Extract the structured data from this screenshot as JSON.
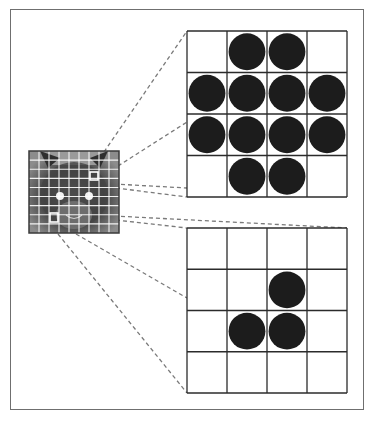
{
  "diagram": {
    "source_image": {
      "icon": "cat-face-image",
      "grid_divisions": 9,
      "highlighted_patches": [
        "top-right patch",
        "bottom-left patch"
      ]
    },
    "patches": [
      {
        "name": "top-patch",
        "rows": 4,
        "cols": 4,
        "pattern": [
          [
            0,
            1,
            1,
            0
          ],
          [
            1,
            1,
            1,
            1
          ],
          [
            1,
            1,
            1,
            1
          ],
          [
            0,
            1,
            1,
            0
          ]
        ]
      },
      {
        "name": "bottom-patch",
        "rows": 4,
        "cols": 4,
        "pattern": [
          [
            0,
            0,
            0,
            0
          ],
          [
            0,
            0,
            1,
            0
          ],
          [
            0,
            1,
            1,
            0
          ],
          [
            0,
            0,
            0,
            0
          ]
        ]
      }
    ],
    "colors": {
      "frame": "#6f6f6f",
      "grid_line": "#2b2b2b",
      "dot": "#1c1c1c",
      "connector": "#7a7a7a",
      "connector_faint": "#d6d6d6",
      "image_grid": "#ffffff"
    }
  }
}
